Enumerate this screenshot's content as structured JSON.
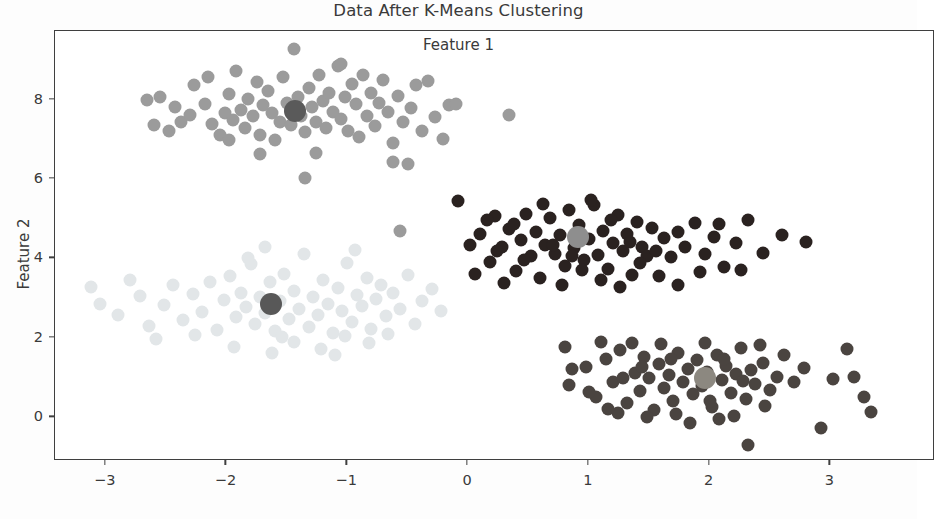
{
  "chart_data": {
    "type": "scatter",
    "title": "Data After K-Means Clustering",
    "xlabel": "Feature 1",
    "ylabel": "Feature 2",
    "xlim": [
      -3.42,
      3.85
    ],
    "ylim": [
      -1.05,
      9.73
    ],
    "xticks": [
      -3,
      -2,
      -1,
      0,
      1,
      2,
      3
    ],
    "xticklabels": [
      "−3",
      "−2",
      "−1",
      "0",
      "1",
      "2",
      "3"
    ],
    "yticks": [
      0,
      2,
      4,
      6,
      8
    ],
    "yticklabels": [
      "0",
      "2",
      "4",
      "6",
      "8"
    ],
    "grid": false,
    "legend": "none",
    "marker_size_px": 13,
    "centroid_size_px": 22,
    "background_color": "#ffffff",
    "axis_color": "#3f3f3f",
    "text_color": "#3a3a3a",
    "clusters": [
      {
        "name": "cluster-top",
        "color": "#9b9b9b",
        "centroid_color": "#5a5a5a",
        "centroid": [
          -1.43,
          7.72
        ],
        "points": [
          [
            -2.66,
            7.99
          ],
          [
            -2.55,
            8.06
          ],
          [
            -2.43,
            7.82
          ],
          [
            -2.38,
            7.45
          ],
          [
            -2.3,
            7.62
          ],
          [
            -2.27,
            8.38
          ],
          [
            -2.18,
            7.9
          ],
          [
            -2.12,
            7.38
          ],
          [
            -2.05,
            7.12
          ],
          [
            -2.01,
            7.66
          ],
          [
            -1.98,
            8.14
          ],
          [
            -1.95,
            7.49
          ],
          [
            -1.92,
            8.72
          ],
          [
            -1.88,
            7.74
          ],
          [
            -1.85,
            7.28
          ],
          [
            -1.82,
            8.02
          ],
          [
            -1.78,
            7.58
          ],
          [
            -1.75,
            8.44
          ],
          [
            -1.72,
            7.11
          ],
          [
            -1.7,
            7.86
          ],
          [
            -1.66,
            8.21
          ],
          [
            -1.62,
            7.66
          ],
          [
            -1.6,
            6.98
          ],
          [
            -1.56,
            7.45
          ],
          [
            -1.53,
            8.58
          ],
          [
            -1.5,
            7.92
          ],
          [
            -1.47,
            7.35
          ],
          [
            -1.44,
            9.28
          ],
          [
            -1.41,
            8.08
          ],
          [
            -1.38,
            7.6
          ],
          [
            -1.35,
            7.18
          ],
          [
            -1.32,
            8.3
          ],
          [
            -1.29,
            7.82
          ],
          [
            -1.26,
            7.44
          ],
          [
            -1.23,
            8.62
          ],
          [
            -1.2,
            7.96
          ],
          [
            -1.18,
            7.28
          ],
          [
            -1.15,
            8.18
          ],
          [
            -1.12,
            7.7
          ],
          [
            -1.08,
            8.85
          ],
          [
            -1.05,
            7.52
          ],
          [
            -1.02,
            8.06
          ],
          [
            -0.99,
            7.22
          ],
          [
            -0.96,
            8.4
          ],
          [
            -0.93,
            7.88
          ],
          [
            -0.9,
            7.06
          ],
          [
            -0.87,
            8.62
          ],
          [
            -0.84,
            7.6
          ],
          [
            -0.8,
            8.18
          ],
          [
            -0.77,
            7.34
          ],
          [
            -0.74,
            7.92
          ],
          [
            -0.7,
            8.5
          ],
          [
            -0.66,
            7.68
          ],
          [
            -0.62,
            6.92
          ],
          [
            -0.58,
            8.1
          ],
          [
            -0.54,
            7.44
          ],
          [
            -0.5,
            6.38
          ],
          [
            -0.47,
            7.8
          ],
          [
            -0.43,
            8.36
          ],
          [
            -0.38,
            7.22
          ],
          [
            -0.33,
            8.48
          ],
          [
            -0.27,
            7.56
          ],
          [
            -0.21,
            7.0
          ],
          [
            -0.16,
            7.86
          ],
          [
            -2.6,
            7.35
          ],
          [
            -2.48,
            7.2
          ],
          [
            -1.98,
            6.98
          ],
          [
            -1.72,
            6.62
          ],
          [
            -1.35,
            6.04
          ],
          [
            -0.56,
            4.7
          ],
          [
            -0.1,
            7.88
          ],
          [
            0.34,
            7.62
          ],
          [
            -2.15,
            8.58
          ],
          [
            -1.05,
            8.9
          ],
          [
            -0.62,
            6.44
          ],
          [
            -1.26,
            6.66
          ]
        ]
      },
      {
        "name": "cluster-left",
        "color": "#e2e6e8",
        "centroid_color": "#585858",
        "centroid": [
          -1.63,
          2.85
        ],
        "points": [
          [
            -3.12,
            3.28
          ],
          [
            -2.9,
            2.58
          ],
          [
            -2.72,
            3.06
          ],
          [
            -2.64,
            2.3
          ],
          [
            -2.52,
            2.82
          ],
          [
            -2.44,
            3.34
          ],
          [
            -2.36,
            2.46
          ],
          [
            -2.28,
            3.1
          ],
          [
            -2.2,
            2.66
          ],
          [
            -2.14,
            3.42
          ],
          [
            -2.08,
            2.2
          ],
          [
            -2.02,
            2.96
          ],
          [
            -1.97,
            3.56
          ],
          [
            -1.92,
            2.52
          ],
          [
            -1.88,
            3.14
          ],
          [
            -1.84,
            2.78
          ],
          [
            -1.8,
            3.86
          ],
          [
            -1.76,
            2.34
          ],
          [
            -1.72,
            3.02
          ],
          [
            -1.68,
            2.62
          ],
          [
            -1.64,
            3.4
          ],
          [
            -1.6,
            2.18
          ],
          [
            -1.56,
            2.92
          ],
          [
            -1.52,
            3.62
          ],
          [
            -1.48,
            2.48
          ],
          [
            -1.44,
            3.18
          ],
          [
            -1.4,
            2.74
          ],
          [
            -1.36,
            4.12
          ],
          [
            -1.32,
            2.28
          ],
          [
            -1.28,
            3.04
          ],
          [
            -1.24,
            2.58
          ],
          [
            -1.2,
            3.46
          ],
          [
            -1.16,
            2.86
          ],
          [
            -1.12,
            2.12
          ],
          [
            -1.08,
            3.26
          ],
          [
            -1.04,
            2.68
          ],
          [
            -1.0,
            3.88
          ],
          [
            -0.96,
            2.4
          ],
          [
            -0.92,
            3.08
          ],
          [
            -0.88,
            2.8
          ],
          [
            -0.84,
            3.52
          ],
          [
            -0.8,
            2.22
          ],
          [
            -0.76,
            2.98
          ],
          [
            -0.72,
            3.32
          ],
          [
            -0.68,
            2.56
          ],
          [
            -0.62,
            3.14
          ],
          [
            -0.56,
            2.74
          ],
          [
            -0.5,
            3.58
          ],
          [
            -0.44,
            2.36
          ],
          [
            -0.38,
            2.94
          ],
          [
            -0.3,
            3.22
          ],
          [
            -0.22,
            2.68
          ],
          [
            -3.05,
            2.86
          ],
          [
            -2.8,
            3.46
          ],
          [
            -2.58,
            1.98
          ],
          [
            -2.26,
            2.08
          ],
          [
            -1.94,
            1.78
          ],
          [
            -1.62,
            1.62
          ],
          [
            -1.44,
            1.9
          ],
          [
            -1.22,
            1.72
          ],
          [
            -1.02,
            2.04
          ],
          [
            -0.82,
            1.86
          ],
          [
            -0.66,
            2.1
          ],
          [
            -1.68,
            4.3
          ],
          [
            -1.82,
            4.02
          ],
          [
            -1.54,
            2.02
          ],
          [
            -1.1,
            1.56
          ],
          [
            -0.94,
            4.22
          ]
        ]
      },
      {
        "name": "cluster-right-middle",
        "color": "#2a2220",
        "centroid_color": "#8e8e8e",
        "centroid": [
          0.91,
          4.55
        ],
        "points": [
          [
            -0.08,
            5.46
          ],
          [
            0.02,
            4.35
          ],
          [
            0.1,
            4.62
          ],
          [
            0.18,
            3.92
          ],
          [
            0.22,
            5.06
          ],
          [
            0.28,
            4.28
          ],
          [
            0.34,
            4.74
          ],
          [
            0.4,
            3.68
          ],
          [
            0.44,
            4.46
          ],
          [
            0.48,
            5.12
          ],
          [
            0.52,
            4.06
          ],
          [
            0.56,
            4.68
          ],
          [
            0.6,
            3.5
          ],
          [
            0.64,
            4.34
          ],
          [
            0.68,
            5.02
          ],
          [
            0.72,
            4.12
          ],
          [
            0.76,
            4.58
          ],
          [
            0.8,
            3.82
          ],
          [
            0.84,
            5.22
          ],
          [
            0.88,
            4.26
          ],
          [
            0.92,
            4.84
          ],
          [
            0.96,
            3.96
          ],
          [
            1.0,
            4.48
          ],
          [
            1.04,
            5.34
          ],
          [
            1.08,
            4.08
          ],
          [
            1.12,
            4.7
          ],
          [
            1.16,
            3.74
          ],
          [
            1.2,
            4.4
          ],
          [
            1.24,
            5.1
          ],
          [
            1.28,
            4.18
          ],
          [
            1.32,
            4.62
          ],
          [
            1.36,
            3.58
          ],
          [
            1.4,
            4.92
          ],
          [
            1.44,
            4.3
          ],
          [
            1.48,
            4.06
          ],
          [
            1.52,
            4.76
          ],
          [
            1.56,
            4.2
          ],
          [
            1.62,
            4.52
          ],
          [
            1.68,
            4.04
          ],
          [
            1.74,
            4.66
          ],
          [
            1.8,
            4.28
          ],
          [
            1.88,
            4.9
          ],
          [
            1.96,
            4.12
          ],
          [
            2.04,
            4.54
          ],
          [
            2.12,
            3.78
          ],
          [
            2.22,
            4.4
          ],
          [
            2.32,
            4.96
          ],
          [
            2.44,
            4.14
          ],
          [
            2.6,
            4.58
          ],
          [
            2.8,
            4.42
          ],
          [
            0.06,
            3.6
          ],
          [
            0.16,
            4.98
          ],
          [
            0.3,
            3.38
          ],
          [
            0.46,
            3.96
          ],
          [
            0.62,
            5.38
          ],
          [
            0.78,
            3.34
          ],
          [
            0.94,
            3.7
          ],
          [
            1.1,
            3.46
          ],
          [
            1.26,
            3.28
          ],
          [
            1.42,
            3.88
          ],
          [
            1.58,
            3.56
          ],
          [
            1.74,
            3.34
          ],
          [
            1.92,
            3.66
          ],
          [
            2.08,
            4.86
          ],
          [
            2.26,
            3.7
          ],
          [
            0.24,
            4.18
          ],
          [
            0.38,
            4.86
          ],
          [
            1.02,
            5.48
          ],
          [
            1.18,
            4.98
          ],
          [
            0.7,
            4.34
          ],
          [
            0.86,
            4.06
          ],
          [
            1.34,
            4.42
          ]
        ]
      },
      {
        "name": "cluster-bottom",
        "color": "#4a4440",
        "centroid_color": "#8c8880",
        "centroid": [
          1.96,
          1.0
        ],
        "points": [
          [
            0.8,
            1.78
          ],
          [
            0.84,
            0.82
          ],
          [
            0.98,
            1.26
          ],
          [
            1.06,
            0.52
          ],
          [
            1.14,
            1.46
          ],
          [
            1.2,
            0.88
          ],
          [
            1.26,
            1.7
          ],
          [
            1.32,
            0.36
          ],
          [
            1.38,
            1.12
          ],
          [
            1.42,
            0.66
          ],
          [
            1.46,
            1.52
          ],
          [
            1.5,
            0.98
          ],
          [
            1.54,
            0.18
          ],
          [
            1.58,
            1.34
          ],
          [
            1.62,
            0.74
          ],
          [
            1.66,
            1.06
          ],
          [
            1.7,
            0.42
          ],
          [
            1.74,
            1.62
          ],
          [
            1.78,
            0.9
          ],
          [
            1.82,
            1.22
          ],
          [
            1.86,
            0.58
          ],
          [
            1.9,
            1.44
          ],
          [
            1.94,
            0.8
          ],
          [
            1.98,
            1.14
          ],
          [
            2.02,
            0.26
          ],
          [
            2.06,
            1.56
          ],
          [
            2.1,
            0.94
          ],
          [
            2.14,
            1.3
          ],
          [
            2.18,
            0.62
          ],
          [
            2.22,
            1.08
          ],
          [
            2.26,
            1.74
          ],
          [
            2.3,
            0.46
          ],
          [
            2.34,
            1.2
          ],
          [
            2.38,
            0.84
          ],
          [
            2.44,
            1.38
          ],
          [
            2.5,
            0.7
          ],
          [
            2.56,
            1.02
          ],
          [
            2.62,
            1.58
          ],
          [
            2.7,
            0.88
          ],
          [
            2.78,
            1.24
          ],
          [
            2.92,
            -0.28
          ],
          [
            3.02,
            0.96
          ],
          [
            3.14,
            1.72
          ],
          [
            3.2,
            1.02
          ],
          [
            3.28,
            0.52
          ],
          [
            3.34,
            0.14
          ],
          [
            0.86,
            1.22
          ],
          [
            1.0,
            0.64
          ],
          [
            1.1,
            1.9
          ],
          [
            1.24,
            0.12
          ],
          [
            1.36,
            1.88
          ],
          [
            1.48,
            0.02
          ],
          [
            1.6,
            1.84
          ],
          [
            1.72,
            0.08
          ],
          [
            1.84,
            -0.14
          ],
          [
            1.96,
            1.86
          ],
          [
            2.08,
            -0.04
          ],
          [
            2.2,
            0.04
          ],
          [
            2.32,
            -0.7
          ],
          [
            2.42,
            1.82
          ],
          [
            1.16,
            0.22
          ],
          [
            1.28,
            0.98
          ],
          [
            1.44,
            1.26
          ],
          [
            1.68,
            1.48
          ],
          [
            2.0,
            0.4
          ],
          [
            2.12,
            1.46
          ],
          [
            2.28,
            0.92
          ],
          [
            2.46,
            0.28
          ]
        ]
      }
    ]
  }
}
